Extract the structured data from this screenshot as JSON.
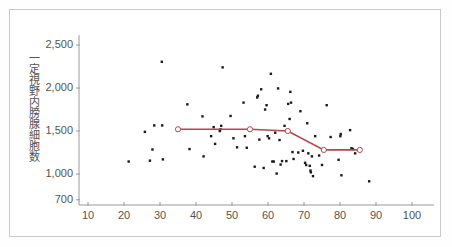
{
  "chart_data": {
    "type": "scatter",
    "title": "",
    "xlabel": "",
    "ylabel": "一定視野内膀腺細胞数",
    "xlim": [
      5,
      105
    ],
    "ylim": [
      700,
      2600
    ],
    "xticks": [
      10,
      20,
      30,
      40,
      50,
      60,
      70,
      80,
      90,
      100
    ],
    "xtick_labels": [
      "10",
      "20",
      "30",
      "40",
      "50",
      "60",
      "70",
      "80",
      "90",
      "100"
    ],
    "yticks": [
      700,
      1000,
      1500,
      2000,
      2500
    ],
    "ytick_labels": [
      "700",
      "1,000",
      "1,500",
      "2,000",
      "2,500"
    ],
    "grid": false,
    "legend": "none",
    "marker_color": "#1a1a1a",
    "line_color": "#b5474b",
    "axis_color": "#9a9a9a",
    "text_color": "#55534f",
    "frame_color": "#c9c9c9",
    "series": [
      {
        "name": "scatter",
        "type": "scatter",
        "points": [
          [
            21.3,
            1145
          ],
          [
            25.8,
            1490
          ],
          [
            27.2,
            1155
          ],
          [
            27.9,
            1285
          ],
          [
            28.4,
            1565
          ],
          [
            30.5,
            2305
          ],
          [
            30.6,
            1565
          ],
          [
            30.8,
            1170
          ],
          [
            37.6,
            1810
          ],
          [
            38.2,
            1290
          ],
          [
            41.8,
            1670
          ],
          [
            42.1,
            1205
          ],
          [
            44.2,
            1440
          ],
          [
            44.9,
            1545
          ],
          [
            45.3,
            1350
          ],
          [
            46.6,
            1500
          ],
          [
            46.8,
            1520
          ],
          [
            47.0,
            1560
          ],
          [
            47.4,
            2240
          ],
          [
            49.6,
            1675
          ],
          [
            50.4,
            1415
          ],
          [
            51.4,
            1310
          ],
          [
            53.2,
            1830
          ],
          [
            53.6,
            1440
          ],
          [
            54.1,
            1305
          ],
          [
            54.8,
            1520
          ],
          [
            56.3,
            1085
          ],
          [
            57.0,
            1890
          ],
          [
            57.2,
            1910
          ],
          [
            57.6,
            1400
          ],
          [
            58.1,
            1985
          ],
          [
            58.8,
            1070
          ],
          [
            59.2,
            1750
          ],
          [
            59.6,
            1800
          ],
          [
            59.9,
            1440
          ],
          [
            60.3,
            1415
          ],
          [
            60.8,
            2165
          ],
          [
            61.2,
            1145
          ],
          [
            61.6,
            1145
          ],
          [
            62.0,
            1480
          ],
          [
            62.4,
            1005
          ],
          [
            62.8,
            1995
          ],
          [
            63.2,
            1395
          ],
          [
            63.5,
            1110
          ],
          [
            63.9,
            1150
          ],
          [
            64.6,
            1560
          ],
          [
            65.1,
            1150
          ],
          [
            65.6,
            1815
          ],
          [
            66.0,
            1640
          ],
          [
            66.2,
            1955
          ],
          [
            66.4,
            1830
          ],
          [
            66.8,
            1255
          ],
          [
            67.1,
            1175
          ],
          [
            68.4,
            1250
          ],
          [
            69.0,
            1730
          ],
          [
            69.7,
            1270
          ],
          [
            70.3,
            1130
          ],
          [
            70.6,
            1105
          ],
          [
            70.9,
            1590
          ],
          [
            71.2,
            1240
          ],
          [
            71.6,
            1095
          ],
          [
            71.8,
            1040
          ],
          [
            71.9,
            1020
          ],
          [
            72.2,
            1205
          ],
          [
            72.5,
            975
          ],
          [
            73.1,
            1440
          ],
          [
            74.2,
            1215
          ],
          [
            75.0,
            1105
          ],
          [
            76.3,
            1800
          ],
          [
            77.4,
            1430
          ],
          [
            79.6,
            1165
          ],
          [
            80.1,
            1440
          ],
          [
            80.2,
            1465
          ],
          [
            80.4,
            985
          ],
          [
            82.8,
            1510
          ],
          [
            83.2,
            1300
          ],
          [
            83.6,
            1290
          ],
          [
            84.2,
            1240
          ],
          [
            88.1,
            915
          ]
        ]
      },
      {
        "name": "trend",
        "type": "line",
        "points": [
          [
            35.0,
            1520
          ],
          [
            55.0,
            1520
          ],
          [
            65.5,
            1500
          ],
          [
            75.5,
            1280
          ],
          [
            85.5,
            1280
          ]
        ],
        "marker": "open-circle"
      }
    ]
  }
}
